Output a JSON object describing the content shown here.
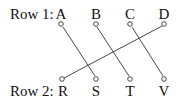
{
  "diagram": {
    "row1": {
      "label": "Row 1:",
      "nodes": [
        {
          "id": "A",
          "label": "A",
          "x": 61
        },
        {
          "id": "B",
          "label": "B",
          "x": 96
        },
        {
          "id": "C",
          "label": "C",
          "x": 130
        },
        {
          "id": "D",
          "label": "D",
          "x": 164
        }
      ]
    },
    "row2": {
      "label": "Row 2:",
      "nodes": [
        {
          "id": "R",
          "label": "R",
          "x": 63
        },
        {
          "id": "S",
          "label": "S",
          "x": 96
        },
        {
          "id": "T",
          "label": "T",
          "x": 130
        },
        {
          "id": "V",
          "label": "V",
          "x": 164
        }
      ]
    },
    "connections": [
      {
        "from": "A",
        "to": "S"
      },
      {
        "from": "B",
        "to": "T"
      },
      {
        "from": "C",
        "to": "V"
      },
      {
        "from": "D",
        "to": "R"
      }
    ],
    "line_color": "#333333"
  }
}
